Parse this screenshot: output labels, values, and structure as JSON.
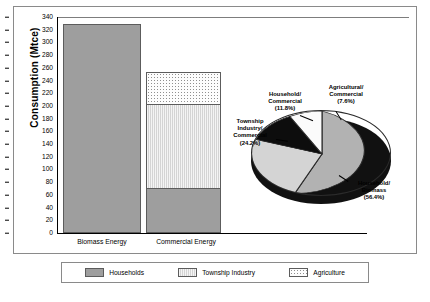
{
  "chart_data": [
    {
      "type": "bar",
      "title": "",
      "xlabel": "",
      "ylabel": "Consumption (Mtce)",
      "categories": [
        "Biomass Energy",
        "Commercial Energy"
      ],
      "ylim": [
        0,
        340
      ],
      "yticks": [
        0,
        20,
        40,
        60,
        80,
        100,
        120,
        140,
        160,
        180,
        200,
        220,
        240,
        260,
        280,
        300,
        320,
        340
      ],
      "grid": false,
      "stacked": true,
      "legend_position": "bottom",
      "series": [
        {
          "name": "Households",
          "values": [
            329,
            70
          ]
        },
        {
          "name": "Township Industry",
          "values": [
            0,
            133
          ]
        },
        {
          "name": "Agriculture",
          "values": [
            0,
            51
          ]
        }
      ],
      "totals": [
        329,
        254
      ]
    },
    {
      "type": "pie",
      "title": "",
      "labels": [
        "Household/ Biomass",
        "Agricultural/ Commercial",
        "Household/ Commercial",
        "Township Industry/ Commercial"
      ],
      "values": [
        56.4,
        7.6,
        11.8,
        24.2
      ],
      "value_suffix": "%"
    }
  ],
  "axis": {
    "y_title": "Consumption (Mtce)",
    "ticks": [
      "340",
      "320",
      "300",
      "280",
      "260",
      "240",
      "220",
      "200",
      "180",
      "160",
      "140",
      "120",
      "100",
      "80",
      "60",
      "40",
      "20",
      "0"
    ],
    "x_labels": [
      "Biomass Energy",
      "Commercial Energy"
    ]
  },
  "pie": {
    "slices": [
      {
        "key": "agricultural_commercial",
        "label_line1": "Agricultural/",
        "label_line2": "Commercial",
        "label_line3": "(7.6%)"
      },
      {
        "key": "household_commercial",
        "label_line1": "Household/",
        "label_line2": "Commercial",
        "label_line3": "(11.8%)"
      },
      {
        "key": "township_commercial",
        "label_line1": "Township",
        "label_line2": "Industry/",
        "label_line3": "Commercial",
        "label_line4": "(24.2%)"
      },
      {
        "key": "household_biomass",
        "label_line1": "Household/",
        "label_line2": "Biomass",
        "label_line3": "(56.4%)"
      }
    ]
  },
  "legend": {
    "items": [
      {
        "label": "Households",
        "swatch": "households-swatch"
      },
      {
        "label": "Township Industry",
        "swatch": "township-industry-swatch"
      },
      {
        "label": "Agriculture",
        "swatch": "agriculture-swatch"
      }
    ]
  },
  "colors": {
    "households": "#9e9e9e",
    "township_industry": "#d4d4d4",
    "agriculture": "#fdfdfd",
    "pie_dark": "#111111",
    "outline": "#5c5c5c"
  }
}
